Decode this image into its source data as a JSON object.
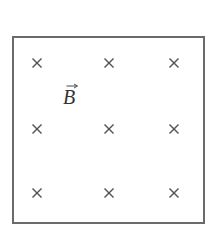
{
  "diagram": {
    "type": "magnetic-field-into-page",
    "box": {
      "x": 12,
      "y": 36,
      "width": 191,
      "height": 186,
      "border_color": "#6a6a6a"
    },
    "field_label": {
      "symbol": "B",
      "vector_arrow": true,
      "x": 63,
      "y": 83
    },
    "crosses": {
      "symbol": "×",
      "meaning": "field directed into page",
      "color": "#555555",
      "positions": [
        {
          "row": 1,
          "col": 1,
          "x": 37,
          "y": 63
        },
        {
          "row": 1,
          "col": 2,
          "x": 109,
          "y": 63
        },
        {
          "row": 1,
          "col": 3,
          "x": 174,
          "y": 63
        },
        {
          "row": 2,
          "col": 1,
          "x": 37,
          "y": 129
        },
        {
          "row": 2,
          "col": 2,
          "x": 109,
          "y": 129
        },
        {
          "row": 2,
          "col": 3,
          "x": 174,
          "y": 129
        },
        {
          "row": 3,
          "col": 1,
          "x": 37,
          "y": 193
        },
        {
          "row": 3,
          "col": 2,
          "x": 109,
          "y": 193
        },
        {
          "row": 3,
          "col": 3,
          "x": 174,
          "y": 193
        }
      ]
    }
  }
}
